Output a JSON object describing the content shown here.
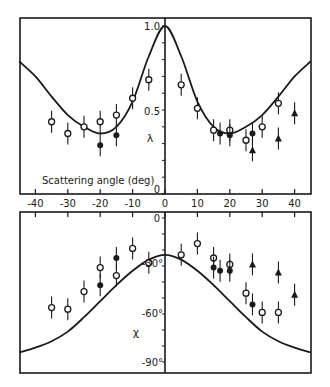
{
  "chart_data": [
    {
      "type": "scatter",
      "panel": "top",
      "title": "",
      "xlabel": "Scattering angle (deg)",
      "ylabel": "λ",
      "xlim": [
        -45,
        45
      ],
      "ylim": [
        0,
        1.0
      ],
      "y_ticks": [
        "0",
        "0.5",
        "1.0"
      ],
      "x_ticks": [
        "-40",
        "-30",
        "-20",
        "-10",
        "0",
        "10",
        "20",
        "30",
        "40"
      ],
      "grid": false,
      "curve": {
        "name": "theory",
        "x": [
          -45,
          -40,
          -35,
          -30,
          -25,
          -20,
          -15,
          -10,
          -5,
          0,
          5,
          10,
          15,
          20,
          25,
          30,
          35,
          40,
          45
        ],
        "y": [
          0.79,
          0.7,
          0.58,
          0.47,
          0.4,
          0.36,
          0.4,
          0.55,
          0.82,
          1.0,
          0.82,
          0.55,
          0.4,
          0.36,
          0.4,
          0.47,
          0.58,
          0.7,
          0.79
        ]
      },
      "series": [
        {
          "name": "open circles",
          "marker": "open-circle",
          "x": [
            -35,
            -30,
            -25,
            -20,
            -15,
            -10,
            -5,
            5,
            10,
            15,
            20,
            25,
            30,
            35
          ],
          "y": [
            0.43,
            0.36,
            0.4,
            0.43,
            0.47,
            0.57,
            0.68,
            0.65,
            0.51,
            0.38,
            0.38,
            0.32,
            0.4,
            0.54
          ]
        },
        {
          "name": "filled circles",
          "marker": "filled-circle",
          "x": [
            -20,
            -15,
            17,
            20,
            27
          ],
          "y": [
            0.29,
            0.35,
            0.36,
            0.35,
            0.36
          ]
        },
        {
          "name": "filled triangles",
          "marker": "filled-triangle",
          "x": [
            27,
            35,
            40
          ],
          "y": [
            0.26,
            0.33,
            0.48
          ]
        }
      ]
    },
    {
      "type": "scatter",
      "panel": "bottom",
      "title": "",
      "xlabel": "",
      "ylabel": "χ",
      "xlim": [
        -45,
        45
      ],
      "ylim": [
        -90,
        0
      ],
      "y_ticks": [
        "0",
        "-30°",
        "-60°",
        "-90°"
      ],
      "grid": false,
      "curve": {
        "name": "theory",
        "x": [
          -45,
          -40,
          -35,
          -30,
          -25,
          -20,
          -15,
          -10,
          -5,
          0,
          5,
          10,
          15,
          20,
          25,
          30,
          35,
          40,
          45
        ],
        "y": [
          -84,
          -81,
          -77,
          -71,
          -62,
          -52,
          -42,
          -33,
          -26,
          -23,
          -26,
          -33,
          -42,
          -52,
          -62,
          -71,
          -77,
          -81,
          -84
        ]
      },
      "series": [
        {
          "name": "open circles",
          "marker": "open-circle",
          "x": [
            -35,
            -30,
            -25,
            -20,
            -15,
            -10,
            -5,
            5,
            10,
            15,
            20,
            25,
            30,
            35
          ],
          "y": [
            -56,
            -57,
            -46,
            -31,
            -36,
            -19,
            -28,
            -23,
            -16,
            -25,
            -29,
            -47,
            -59,
            -59
          ]
        },
        {
          "name": "filled circles",
          "marker": "filled-circle",
          "x": [
            -20,
            -15,
            15,
            17,
            20,
            27
          ],
          "y": [
            -42,
            -25,
            -31,
            -33,
            -33,
            -54
          ]
        },
        {
          "name": "filled triangles",
          "marker": "filled-triangle",
          "x": [
            27,
            35,
            40
          ],
          "y": [
            -29,
            -34,
            -48
          ]
        }
      ]
    }
  ],
  "labels": {
    "top_xlabel": "Scattering angle (deg)",
    "top_ylabel": "λ",
    "bottom_ylabel": "χ",
    "top_yticks": [
      "1.0",
      "0.5",
      "0"
    ],
    "bottom_yticks": [
      "0",
      "-30°",
      "-60°",
      "-90°"
    ],
    "xticks": [
      "-40",
      "-30",
      "-20",
      "-10",
      "0",
      "10",
      "20",
      "30",
      "40"
    ]
  },
  "colors": {
    "ink": "#1a1a1a",
    "background": "#ffffff"
  }
}
